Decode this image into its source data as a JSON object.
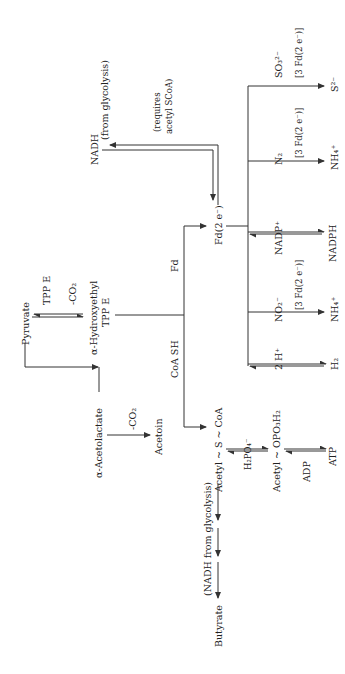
{
  "diagram": {
    "orientation": "rotated-90-ccw",
    "nodes": {
      "pyruvate": "Pyruvate",
      "tpp_e": "TPP E",
      "co2_loss_1": "-CO₂",
      "hydroxyethyl_1": "α-Hydroxyethyl",
      "hydroxyethyl_2": "TPP E",
      "acetolactate": "α-Acetolactate",
      "co2_loss_2": "-CO₂",
      "acetoin": "Acetoin",
      "fd": "Fd",
      "coa_sh": "CoA SH",
      "fd_2e": "Fd(2 e⁻)",
      "acetyl_scoa": "Acetyl ~ S ~ CoA",
      "h2po4": "H₂PO₄⁻",
      "acetyl_phosphate": "Acetyl ~ OPO₃H₂",
      "adp": "ADP",
      "atp": "ATP",
      "nadh": "NADH",
      "from_glycolysis": "(from glycolysis)",
      "requires_1": "(requires",
      "requires_2": "acetyl SCoA)",
      "nadh_glycolysis": "(NADH from glycolysis)",
      "butyrate": "Butyrate",
      "h_plus": "2 H⁺",
      "h2": "H₂",
      "no2": "NO₂⁻",
      "fd3_a": "[3 Fd(2 e⁻)]",
      "nh4_a": "NH₄⁺",
      "nadp": "NADP⁺",
      "nadph": "NADPH",
      "n2": "N₂",
      "fd3_b": "[3 Fd(2 e⁻)]",
      "nh4_b": "NH₄⁺",
      "so3": "SO₃²⁻",
      "fd3_c": "[3 Fd(2 e⁻)]",
      "s2": "S²⁻"
    },
    "colors": {
      "line": "#333333",
      "text": "#222222",
      "background": "#ffffff"
    }
  }
}
